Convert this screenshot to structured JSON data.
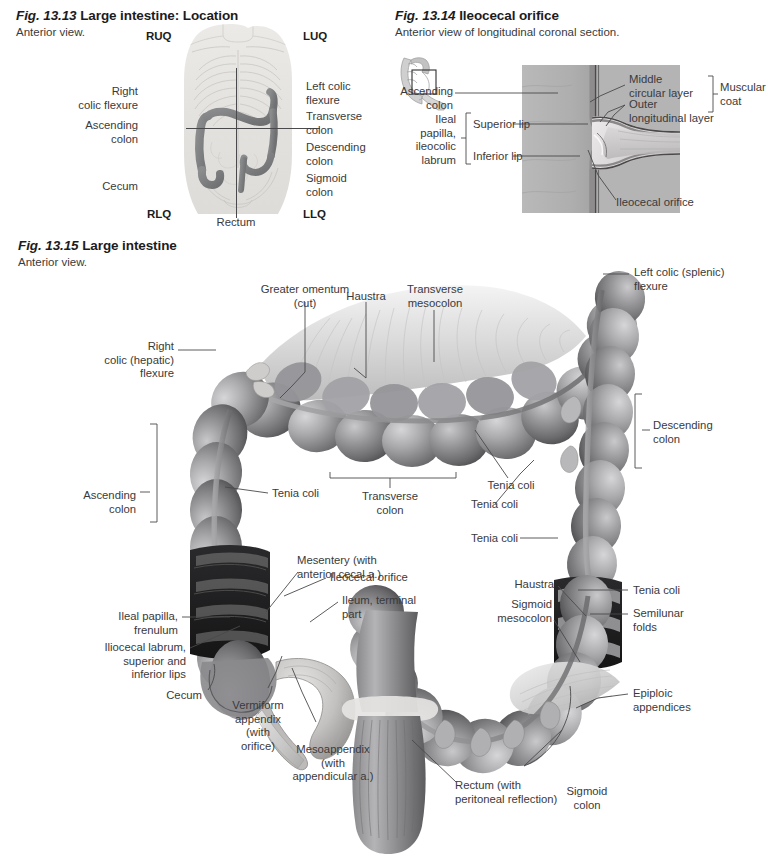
{
  "page": {
    "width": 765,
    "height": 857,
    "background": "#ffffff",
    "text_color": "#3a3a3c",
    "heading_color": "#1c1c1e",
    "leader_color": "#4a4a4c"
  },
  "figures": [
    {
      "id": "fig-13-13",
      "number": "Fig. 13.13",
      "title": "Large intestine: Location",
      "subtitle": "Anterior view.",
      "quadrants": [
        {
          "name": "quadrant-ruq",
          "label": "RUQ"
        },
        {
          "name": "quadrant-luq",
          "label": "LUQ"
        },
        {
          "name": "quadrant-rlq",
          "label": "RLQ"
        },
        {
          "name": "quadrant-llq",
          "label": "LLQ"
        }
      ],
      "labels": [
        {
          "name": "label-right-colic-flexure",
          "text": "Right\ncolic flexure",
          "align": "right"
        },
        {
          "name": "label-ascending-colon",
          "text": "Ascending\ncolon",
          "align": "right"
        },
        {
          "name": "label-cecum",
          "text": "Cecum",
          "align": "right"
        },
        {
          "name": "label-left-colic-flexure",
          "text": "Left colic\nflexure",
          "align": "left"
        },
        {
          "name": "label-transverse-colon",
          "text": "Transverse\ncolon",
          "align": "left"
        },
        {
          "name": "label-descending-colon",
          "text": "Descending\ncolon",
          "align": "left"
        },
        {
          "name": "label-sigmoid-colon",
          "text": "Sigmoid\ncolon",
          "align": "left"
        },
        {
          "name": "label-rectum",
          "text": "Rectum",
          "align": "center"
        }
      ]
    },
    {
      "id": "fig-13-14",
      "number": "Fig. 13.14",
      "title": "Ileocecal orifice",
      "subtitle": "Anterior view of longitudinal coronal section.",
      "labels": [
        {
          "name": "label-ascending-colon",
          "text": "Ascending\ncolon",
          "align": "right"
        },
        {
          "name": "label-ileal-papilla",
          "text": "Ileal\npapilla,\nileocolic\nlabrum",
          "align": "right"
        },
        {
          "name": "label-superior-lip",
          "text": "Superior lip",
          "align": "left"
        },
        {
          "name": "label-inferior-lip",
          "text": "Inferior lip",
          "align": "left"
        },
        {
          "name": "label-middle-circular-layer",
          "text": "Middle\ncircular layer",
          "align": "left"
        },
        {
          "name": "label-outer-longitudinal-layer",
          "text": "Outer\nlongitudinal layer",
          "align": "left"
        },
        {
          "name": "label-muscular-coat",
          "text": "Muscular\ncoat",
          "align": "left"
        },
        {
          "name": "label-ileocecal-orifice",
          "text": "Ileocecal orifice",
          "align": "left"
        }
      ]
    },
    {
      "id": "fig-13-15",
      "number": "Fig. 13.15",
      "title": "Large intestine",
      "subtitle": "Anterior view.",
      "labels": [
        {
          "name": "label-greater-omentum-cut",
          "text": "Greater omentum\n(cut)",
          "align": "center"
        },
        {
          "name": "label-haustra-top",
          "text": "Haustra",
          "align": "center"
        },
        {
          "name": "label-transverse-mesocolon",
          "text": "Transverse\nmesocolon",
          "align": "center"
        },
        {
          "name": "label-left-colic-splenic-flexure",
          "text": "Left colic (splenic)\nflexure",
          "align": "left"
        },
        {
          "name": "label-right-colic-hepatic-flexure",
          "text": "Right\ncolic (hepatic)\nflexure",
          "align": "right"
        },
        {
          "name": "label-descending-colon",
          "text": "Descending\ncolon",
          "align": "left"
        },
        {
          "name": "label-ascending-colon",
          "text": "Ascending\ncolon",
          "align": "right"
        },
        {
          "name": "label-tenia-coli-left",
          "text": "Tenia coli",
          "align": "left"
        },
        {
          "name": "label-transverse-colon",
          "text": "Transverse\ncolon",
          "align": "center"
        },
        {
          "name": "label-tenia-coli-center",
          "text": "Tenia coli",
          "align": "center"
        },
        {
          "name": "label-tenia-coli-right-upper",
          "text": "Tenia coli",
          "align": "right"
        },
        {
          "name": "label-tenia-coli-right-mid",
          "text": "Tenia coli",
          "align": "right"
        },
        {
          "name": "label-tenia-coli-right-lower",
          "text": "Tenia coli",
          "align": "left"
        },
        {
          "name": "label-mesentery-anterior-cecal",
          "text": "Mesentery (with\nanterior cecal a.)",
          "align": "left"
        },
        {
          "name": "label-ileocecal-orifice",
          "text": "Ileocecal orifice",
          "align": "left"
        },
        {
          "name": "label-ileum-terminal-part",
          "text": "Ileum, terminal\npart",
          "align": "left"
        },
        {
          "name": "label-ileal-papilla-frenulum",
          "text": "Ileal papilla,\nfrenulum",
          "align": "right"
        },
        {
          "name": "label-iliocecal-labrum",
          "text": "Iliocecal labrum,\nsuperior and\ninferior lips",
          "align": "right"
        },
        {
          "name": "label-cecum",
          "text": "Cecum",
          "align": "right"
        },
        {
          "name": "label-vermiform-appendix",
          "text": "Vermiform\nappendix\n(with\norifice)",
          "align": "center"
        },
        {
          "name": "label-mesoappendix",
          "text": "Mesoappendix\n(with\nappendicular a.)",
          "align": "center"
        },
        {
          "name": "label-haustra-lower",
          "text": "Haustra",
          "align": "right"
        },
        {
          "name": "label-sigmoid-mesocolon",
          "text": "Sigmoid\nmesocolon",
          "align": "right"
        },
        {
          "name": "label-semilunar-folds",
          "text": "Semilunar\nfolds",
          "align": "left"
        },
        {
          "name": "label-epiploic-appendices",
          "text": "Epiploic\nappendices",
          "align": "left"
        },
        {
          "name": "label-sigmoid-colon",
          "text": "Sigmoid\ncolon",
          "align": "center"
        },
        {
          "name": "label-rectum-peritoneal-reflection",
          "text": "Rectum (with\nperitoneal reflection)",
          "align": "left"
        }
      ]
    }
  ]
}
